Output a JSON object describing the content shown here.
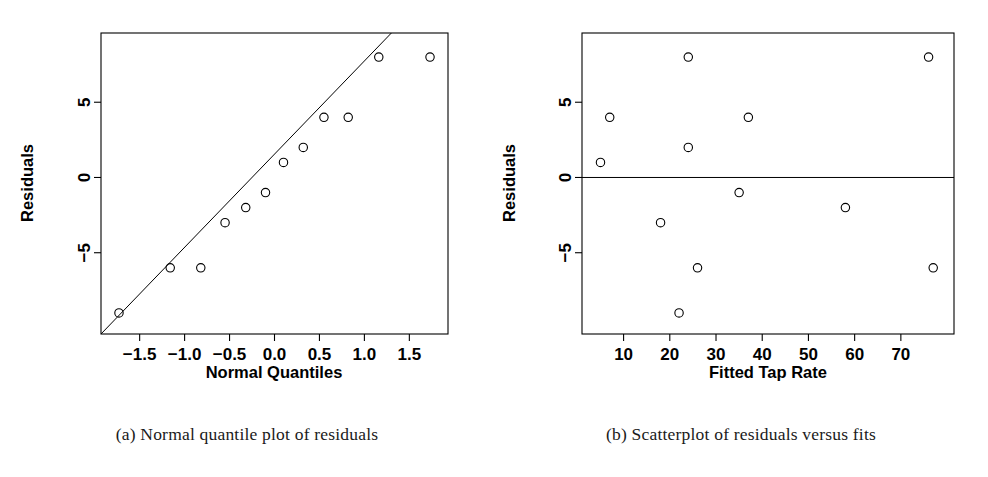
{
  "figure": {
    "captions": [
      "(a) Normal quantile plot of residuals",
      "(b) Scatterplot of residuals versus fits"
    ]
  },
  "chart_data": [
    {
      "type": "scatter",
      "panel": "a",
      "title": "(a) Normal quantile plot of residuals",
      "xlabel": "Normal Quantiles",
      "ylabel": "Residuals",
      "xlim": [
        -1.93,
        1.93
      ],
      "ylim": [
        -10.4,
        9.6
      ],
      "xticks": [
        -1.5,
        -1.0,
        -0.5,
        0.0,
        0.5,
        1.0,
        1.5
      ],
      "xticklabels": [
        "-1.5",
        "-1.0",
        "-0.5",
        "0.0",
        "0.5",
        "1.0",
        "1.5"
      ],
      "yticks": [
        -5,
        0,
        5
      ],
      "yticklabels": [
        "-5",
        "0",
        "5"
      ],
      "grid": false,
      "legend": "none",
      "marker": "open-circle",
      "x": [
        -1.73,
        -1.16,
        -0.82,
        -0.55,
        -0.32,
        -0.1,
        0.1,
        0.32,
        0.55,
        0.82,
        1.16,
        1.73
      ],
      "y": [
        -9,
        -6,
        -6,
        -3,
        -2,
        -1,
        1,
        2,
        4,
        4,
        8,
        8
      ],
      "reference_line": {
        "label": "normal reference line",
        "x": [
          -1.93,
          1.3
        ],
        "y": [
          -10.4,
          9.6
        ]
      }
    },
    {
      "type": "scatter",
      "panel": "b",
      "title": "(b) Scatterplot of residuals versus fits",
      "xlabel": "Fitted Tap Rate",
      "ylabel": "Residuals",
      "xlim": [
        1.0,
        81.5
      ],
      "ylim": [
        -10.4,
        9.6
      ],
      "xticks": [
        10,
        20,
        30,
        40,
        50,
        60,
        70
      ],
      "xticklabels": [
        "10",
        "20",
        "30",
        "40",
        "50",
        "60",
        "70"
      ],
      "yticks": [
        -5,
        0,
        5
      ],
      "yticklabels": [
        "-5",
        "0",
        "5"
      ],
      "grid": false,
      "legend": "none",
      "marker": "open-circle",
      "x": [
        5,
        7,
        18,
        22,
        24,
        24,
        26,
        35,
        37,
        58,
        76,
        77
      ],
      "y": [
        1,
        4,
        -3,
        -9,
        8,
        2,
        -6,
        -1,
        4,
        -2,
        8,
        -6
      ],
      "reference_line": {
        "label": "zero residual line",
        "x": [
          1.0,
          81.5
        ],
        "y": [
          0,
          0
        ]
      }
    }
  ]
}
